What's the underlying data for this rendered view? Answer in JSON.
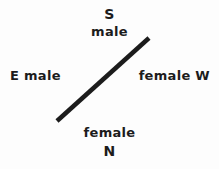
{
  "figure": {
    "width": 219,
    "height": 169,
    "background_color": "#fdfdfd",
    "ink_color": "#1c1c1c"
  },
  "labels": {
    "direction_top": "S",
    "sex_top": "male",
    "left_group": "E male",
    "right_group": "female W",
    "sex_bottom": "female",
    "direction_bottom": "N"
  },
  "axis_line": {
    "x1": 57,
    "y1": 121,
    "x2": 149,
    "y2": 38,
    "stroke_width": 4.5,
    "color": "#1c1c1c"
  }
}
